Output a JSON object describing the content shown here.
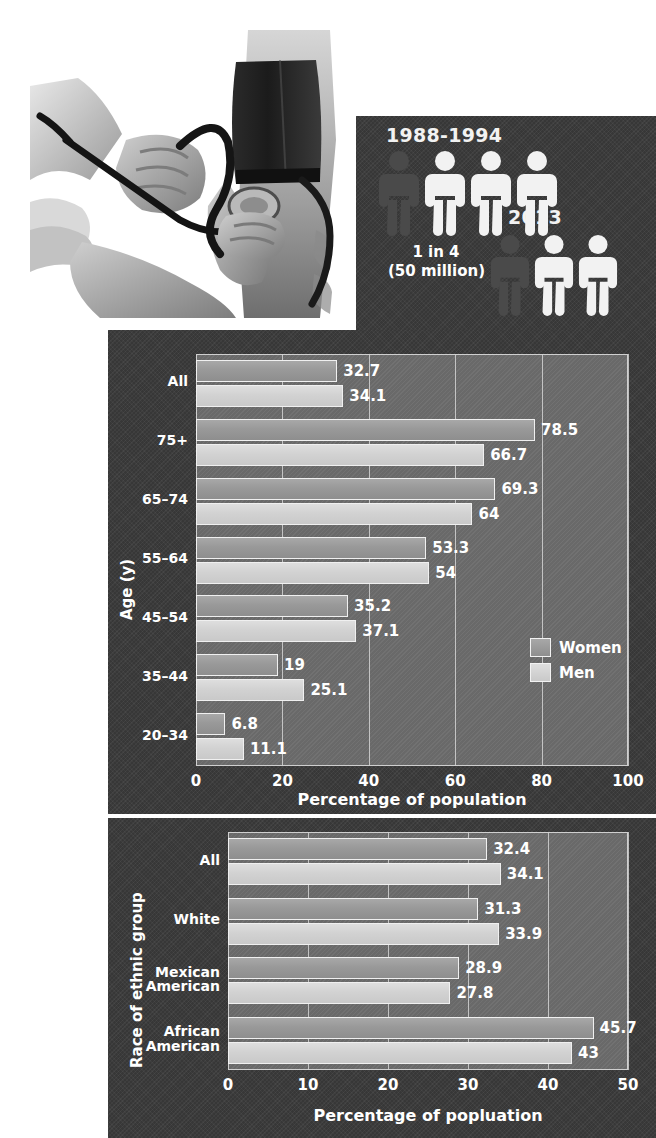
{
  "photo": {
    "alt": "Illustration of blood pressure being measured with a cuff, bulb and stethoscope on a patient's arm"
  },
  "pictogram": {
    "groups": [
      {
        "period": "1988-1994",
        "ratio": "1 in 4",
        "count": "(50 million)",
        "total_figures": 4,
        "highlighted_figures": 1
      },
      {
        "period": "2013",
        "ratio": "1 in 3",
        "count": "(77.9 million)",
        "total_figures": 3,
        "highlighted_figures": 1
      }
    ],
    "colors": {
      "figure_light": "#f2f2f2",
      "figure_dark": "#4a4a4a",
      "panel_bg": "#3b3b3b"
    }
  },
  "chart_data": [
    {
      "type": "bar",
      "orientation": "horizontal",
      "title": "",
      "xlabel": "Percentage of population",
      "ylabel": "Age (y)",
      "xlim": [
        0,
        100
      ],
      "xticks": [
        0,
        20,
        40,
        60,
        80,
        100
      ],
      "grid": true,
      "legend_position": "inside-bottom-right",
      "categories": [
        "All",
        "75+",
        "65–74",
        "55–64",
        "45–54",
        "35–44",
        "20–34"
      ],
      "series": [
        {
          "name": "Women",
          "color": "#999999",
          "values": [
            32.7,
            78.5,
            69.3,
            53.3,
            35.2,
            19,
            6.8
          ],
          "value_labels": [
            "32.7",
            "78.5",
            "69.3",
            "53.3",
            "35.2",
            "19",
            "6.8"
          ]
        },
        {
          "name": "Men",
          "color": "#d2d2d2",
          "values": [
            34.1,
            66.7,
            64,
            54,
            37.1,
            25.1,
            11.1
          ],
          "value_labels": [
            "34.1",
            "66.7",
            "64",
            "54",
            "37.1",
            "25.1",
            "11.1"
          ]
        }
      ]
    },
    {
      "type": "bar",
      "orientation": "horizontal",
      "title": "",
      "xlabel": "Percentage of popluation",
      "ylabel": "Race of ethnic group",
      "xlim": [
        0,
        50
      ],
      "xticks": [
        0,
        10,
        20,
        30,
        40,
        50
      ],
      "grid": true,
      "legend_position": "none",
      "categories": [
        "All",
        "White",
        "Mexican\nAmerican",
        "African\nAmerican"
      ],
      "series": [
        {
          "name": "Women",
          "color": "#999999",
          "values": [
            32.4,
            31.3,
            28.9,
            45.7
          ],
          "value_labels": [
            "32.4",
            "31.3",
            "28.9",
            "45.7"
          ]
        },
        {
          "name": "Men",
          "color": "#d2d2d2",
          "values": [
            34.1,
            33.9,
            27.8,
            43
          ],
          "value_labels": [
            "34.1",
            "33.9",
            "27.8",
            "43"
          ]
        }
      ]
    }
  ]
}
